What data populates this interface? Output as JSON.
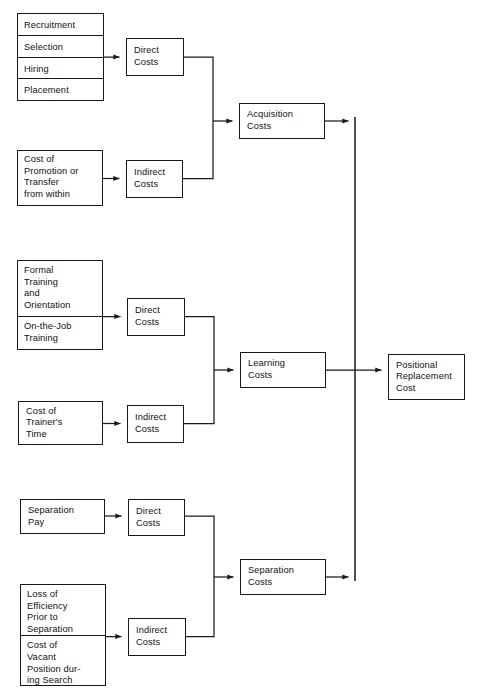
{
  "diagram": {
    "line_color": "#1a1a1a",
    "box_fill": "#ffffff",
    "text_color": "#111111"
  },
  "groups": [
    {
      "id": "acquisition",
      "inputs_direct": {
        "items": [
          "Recruitment",
          "Selection",
          "Hiring",
          "Placement"
        ]
      },
      "inputs_indirect": {
        "items": [
          "Cost of\nPromotion or\nTransfer\nfrom within"
        ]
      },
      "direct_label": "Direct\nCosts",
      "indirect_label": "Indirect\nCosts",
      "total_label": "Acquisition\nCosts"
    },
    {
      "id": "learning",
      "inputs_direct": {
        "items": [
          "Formal\nTraining\nand\nOrientation",
          "On-the-Job\nTraining"
        ]
      },
      "inputs_indirect": {
        "items": [
          "Cost of\nTrainer's\nTime"
        ]
      },
      "direct_label": "Direct\nCosts",
      "indirect_label": "Indirect\nCosts",
      "total_label": "Learning\nCosts"
    },
    {
      "id": "separation",
      "inputs_direct": {
        "items": [
          "Separation\nPay"
        ]
      },
      "inputs_indirect": {
        "items": [
          "Loss of\nEfficiency\nPrior to\nSeparation",
          "Cost of\nVacant\nPosition dur-\ning Search"
        ]
      },
      "direct_label": "Direct\nCosts",
      "indirect_label": "Indirect\nCosts",
      "total_label": "Separation\nCosts"
    }
  ],
  "final": {
    "label": "Positional\nReplacement\nCost"
  }
}
